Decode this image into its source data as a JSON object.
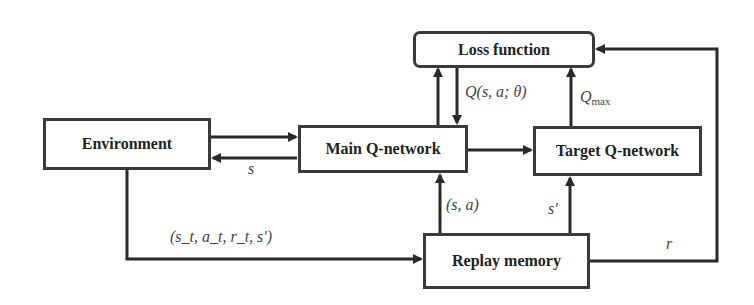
{
  "diagram": {
    "nodes": {
      "loss": {
        "label": "Loss function"
      },
      "environment": {
        "label": "Environment"
      },
      "main_q": {
        "label": "Main Q-network"
      },
      "target_q": {
        "label": "Target Q-network"
      },
      "replay": {
        "label": "Replay memory"
      }
    },
    "edges": [
      {
        "from": "environment",
        "to": "main_q",
        "label": ""
      },
      {
        "from": "main_q",
        "to": "environment",
        "label": "s"
      },
      {
        "from": "main_q",
        "to": "loss",
        "label": ""
      },
      {
        "from": "loss",
        "to": "main_q",
        "label": "Q(s, a; θ)"
      },
      {
        "from": "target_q",
        "to": "loss",
        "label": "Q_max"
      },
      {
        "from": "main_q",
        "to": "target_q",
        "label": ""
      },
      {
        "from": "replay",
        "to": "main_q",
        "label": "(s, a)"
      },
      {
        "from": "replay",
        "to": "target_q",
        "label": "s′"
      },
      {
        "from": "environment",
        "to": "replay",
        "label": "(s_t, a_t, r_t, s′)"
      },
      {
        "from": "replay",
        "to": "loss",
        "label": "r"
      }
    ],
    "labels": {
      "s": "s",
      "q_theta": "Q(s, a; θ)",
      "q_max_main": "Q",
      "q_max_sub": "max",
      "sa": "(s, a)",
      "s_prime": "s′",
      "transition": "(s_t, a_t, r_t, s′)",
      "r": "r"
    },
    "colors": {
      "stroke": "#2a2a2a",
      "box_border": "#3a3a3a",
      "text": "#222222",
      "label": "#444444",
      "background": "#ffffff"
    }
  }
}
